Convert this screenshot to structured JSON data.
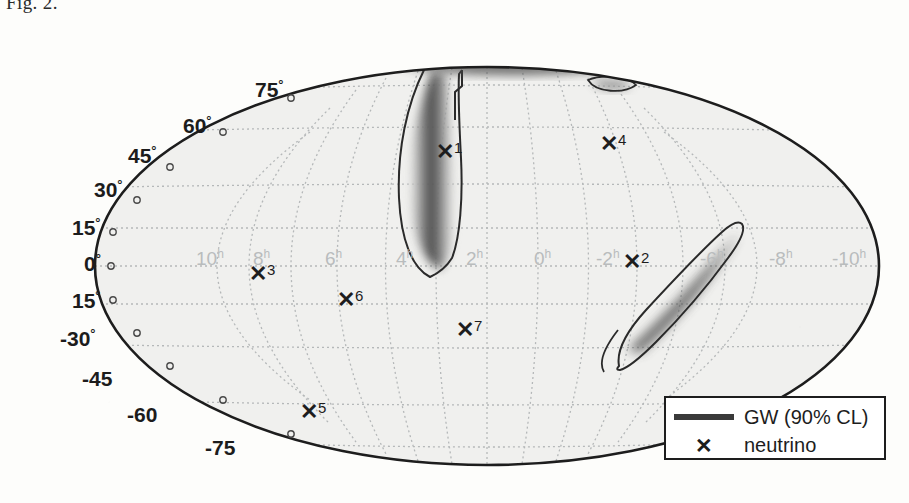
{
  "figure": {
    "caption_fragment": "Fig. 2.",
    "projection": "Mollweide",
    "ellipse": {
      "cx": 487,
      "cy": 266,
      "rx": 392,
      "ry": 199
    }
  },
  "axes": {
    "dec_unit": "°",
    "ra_unit": "h",
    "dec_labels": [
      {
        "text": "75",
        "x": 255,
        "y": 78
      },
      {
        "text": "60",
        "x": 183,
        "y": 114
      },
      {
        "text": "45",
        "x": 128,
        "y": 144
      },
      {
        "text": "30",
        "x": 94,
        "y": 178
      },
      {
        "text": "15",
        "x": 72,
        "y": 216
      },
      {
        "text": "0",
        "x": 84,
        "y": 252
      },
      {
        "text": "15",
        "x": 72,
        "y": 289
      },
      {
        "text": "-30",
        "x": 60,
        "y": 327
      },
      {
        "text": "-45",
        "x": 82,
        "y": 368
      },
      {
        "text": "-60",
        "x": 127,
        "y": 404
      },
      {
        "text": "-75",
        "x": 205,
        "y": 437
      }
    ],
    "ra_labels": [
      {
        "text": "10",
        "x": 196,
        "y": 248
      },
      {
        "text": "8",
        "x": 253,
        "y": 248
      },
      {
        "text": "6",
        "x": 325,
        "y": 248
      },
      {
        "text": "4",
        "x": 396,
        "y": 248
      },
      {
        "text": "2",
        "x": 466,
        "y": 248
      },
      {
        "text": "0",
        "x": 534,
        "y": 248
      },
      {
        "text": "-2",
        "x": 596,
        "y": 248
      },
      {
        "text": "-4",
        "x": 663,
        "y": 248
      },
      {
        "text": "-6",
        "x": 700,
        "y": 248
      },
      {
        "text": "-8",
        "x": 769,
        "y": 248
      },
      {
        "text": "-10",
        "x": 832,
        "y": 248
      }
    ]
  },
  "neutrinos": [
    {
      "id": "1",
      "x": 436,
      "y": 140
    },
    {
      "id": "4",
      "x": 600,
      "y": 132
    },
    {
      "id": "3",
      "x": 249,
      "y": 262
    },
    {
      "id": "2",
      "x": 623,
      "y": 250
    },
    {
      "id": "6",
      "x": 337,
      "y": 288
    },
    {
      "id": "7",
      "x": 456,
      "y": 318
    },
    {
      "id": "5",
      "x": 300,
      "y": 400
    }
  ],
  "legend": {
    "gw_label": "GW (90% CL)",
    "neutrino_label": "neutrino",
    "neutrino_marker": "✕",
    "gw_swatch_color": "#3a3a3a"
  },
  "colors": {
    "map_fill": "#f0f0ee",
    "graticule": "#b9bcbd",
    "outline": "#1d1d1d",
    "contour": "#2a2a2a",
    "text": "#1d1d1d",
    "ra_text": "#b9bcbd"
  }
}
